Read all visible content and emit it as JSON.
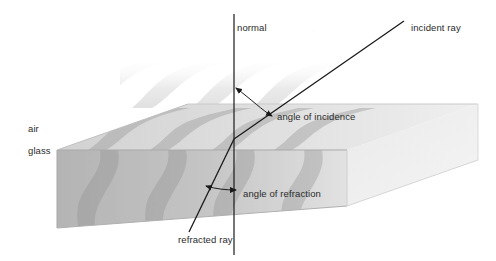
{
  "figure": {
    "type": "physics-optics-diagram",
    "width": 496,
    "height": 261,
    "background": "#ffffff"
  },
  "labels": {
    "normal": "normal",
    "incident_ray": "incident ray",
    "angle_of_incidence": "angle of incidence",
    "angle_of_refraction": "angle of refraction",
    "refracted_ray": "refracted ray",
    "air": "air",
    "glass": "glass"
  },
  "colors": {
    "line": "#1a1a1a",
    "text": "#2b2b2b",
    "glass_top": "#dcdcdc",
    "glass_front": "#b8b8b8",
    "glass_left": "#c6c6c6",
    "glass_end": "#e8e8e8",
    "wavefront": "#a8a8a8",
    "wavefront_air": "#d8d8d8",
    "background": "#ffffff"
  },
  "geometry": {
    "normal_line": {
      "x": 234,
      "y_top": 14,
      "y_bottom": 255
    },
    "incidence_point": {
      "x": 234,
      "y": 139
    },
    "incident_ray": {
      "x1": 234,
      "y1": 139,
      "x2": 404,
      "y2": 21
    },
    "refracted_ray": {
      "x1": 234,
      "y1": 139,
      "x2": 189,
      "y2": 232
    },
    "arc_incidence": {
      "from_deg": 0,
      "to_deg": 55,
      "radius": 52
    },
    "arc_refraction": {
      "from_deg": 180,
      "to_deg": 206,
      "radius": 30
    },
    "block_front_top_left": {
      "x": 57,
      "y": 150
    },
    "block_front_bottom_left": {
      "x": 57,
      "y": 228
    },
    "block_right_end": {
      "x": 478,
      "y": 104
    }
  },
  "wavefronts": {
    "count_in_glass": 4,
    "count_in_air": 4,
    "description": "S-shaped wavefront bands bending as they cross the air-glass boundary"
  }
}
